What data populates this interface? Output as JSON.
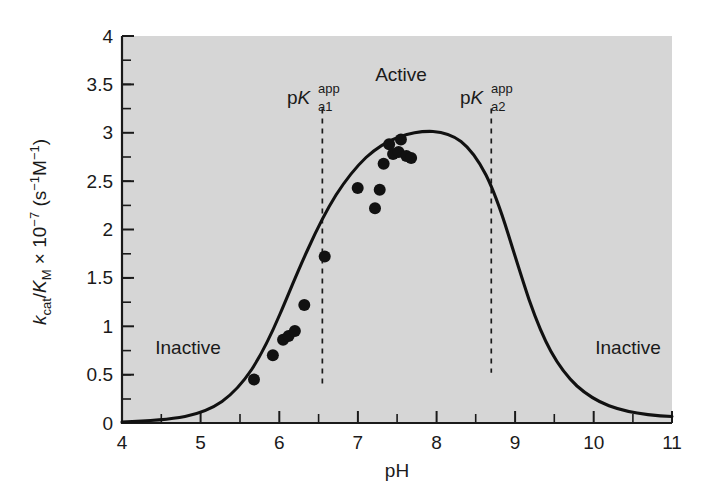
{
  "chart_data": {
    "type": "scatter",
    "title": "",
    "xlabel": "pH",
    "ylabel_parts": {
      "k": "k",
      "cat": "cat",
      "slash": "/",
      "K": "K",
      "M": "M",
      "times": " × 10",
      "exp": "−7",
      "units_open": " (s",
      "units_exp1": "−1",
      "units_M": "M",
      "units_exp2": "−1",
      "units_close": ")"
    },
    "ylabel": "kcat/KM × 10−7 (s−1M−1)",
    "xlim": [
      4,
      11
    ],
    "ylim": [
      0,
      4
    ],
    "xticks": [
      4,
      5,
      6,
      7,
      8,
      9,
      10,
      11
    ],
    "xtick_labels": [
      "4",
      "5",
      "6",
      "7",
      "8",
      "9",
      "10",
      "11"
    ],
    "xminor_step": 0.5,
    "yticks": [
      0,
      0.5,
      1,
      1.5,
      2,
      2.5,
      3,
      3.5,
      4
    ],
    "ytick_labels": [
      "0",
      "0.5",
      "1",
      "1.5",
      "2",
      "2.5",
      "3",
      "3.5",
      "4"
    ],
    "yminor_step": 0.25,
    "grid": false,
    "legend": "none",
    "plot_bg_color": "#d6d6d6",
    "curve_color": "#111111",
    "point_color": "#111111",
    "points": [
      {
        "x": 5.68,
        "y": 0.45
      },
      {
        "x": 5.92,
        "y": 0.7
      },
      {
        "x": 6.05,
        "y": 0.86
      },
      {
        "x": 6.12,
        "y": 0.9
      },
      {
        "x": 6.2,
        "y": 0.95
      },
      {
        "x": 6.32,
        "y": 1.22
      },
      {
        "x": 6.58,
        "y": 1.72
      },
      {
        "x": 7.0,
        "y": 2.43
      },
      {
        "x": 7.22,
        "y": 2.22
      },
      {
        "x": 7.28,
        "y": 2.41
      },
      {
        "x": 7.33,
        "y": 2.68
      },
      {
        "x": 7.4,
        "y": 2.88
      },
      {
        "x": 7.45,
        "y": 2.78
      },
      {
        "x": 7.52,
        "y": 2.8
      },
      {
        "x": 7.55,
        "y": 2.93
      },
      {
        "x": 7.62,
        "y": 2.76
      },
      {
        "x": 7.68,
        "y": 2.74
      }
    ],
    "fit_curve": {
      "description": "bell-shaped pH-rate profile",
      "pka1": 6.55,
      "pka2": 8.7,
      "max_value": 2.78,
      "max_at_ph": 7.75,
      "value_at_ph11": 0.15,
      "value_at_ph4": 0.01
    },
    "annotations": [
      {
        "name": "active-label",
        "text": "Active",
        "x": 7.55,
        "y": 3.62
      },
      {
        "name": "inactive-left-label",
        "text": "Inactive",
        "x": 4.85,
        "y": 0.78
      },
      {
        "name": "inactive-right-label",
        "text": "Inactive",
        "x": 10.05,
        "y": 0.78
      }
    ],
    "pk_markers": [
      {
        "name": "pka1-marker",
        "ph": 6.55,
        "label_base": "p",
        "label_K": "K",
        "label_sub": "a1",
        "label_sup": "app",
        "label_text": "pKa1app",
        "y_top": 3.25,
        "y_bottom": 0.38
      },
      {
        "name": "pka2-marker",
        "ph": 8.7,
        "label_base": "p",
        "label_K": "K",
        "label_sub": "a2",
        "label_sup": "app",
        "label_text": "pKa2app",
        "y_top": 3.25,
        "y_bottom": 0.52
      }
    ]
  }
}
